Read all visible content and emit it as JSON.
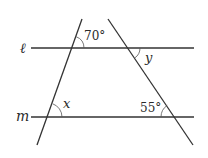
{
  "diagram": {
    "type": "geometry",
    "lines": {
      "l": {
        "label": "ℓ"
      },
      "m": {
        "label": "m"
      }
    },
    "angles": {
      "top_left": {
        "label": "70°",
        "value_deg": 70
      },
      "top_right": {
        "label": "y"
      },
      "bottom_left": {
        "label": "x"
      },
      "bottom_right": {
        "label": "55°",
        "value_deg": 55
      }
    },
    "colors": {
      "stroke": "#333333",
      "arc": "#555555",
      "text": "#2a2a2a"
    }
  }
}
